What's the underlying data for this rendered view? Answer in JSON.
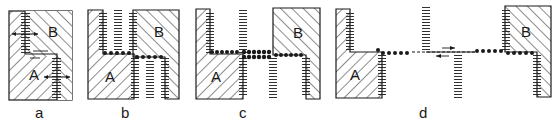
{
  "figure": {
    "panels": [
      {
        "id": "a",
        "label": "a",
        "grain_a": "A",
        "grain_b": "B"
      },
      {
        "id": "b",
        "label": "b",
        "grain_a": "A",
        "grain_b": "B"
      },
      {
        "id": "c",
        "label": "c",
        "grain_a": "A",
        "grain_b": "B"
      },
      {
        "id": "d",
        "label": "d",
        "grain_a": "A",
        "grain_b": "B"
      }
    ],
    "colors": {
      "ink": "#1a1a1a",
      "background": "#ffffff"
    }
  }
}
